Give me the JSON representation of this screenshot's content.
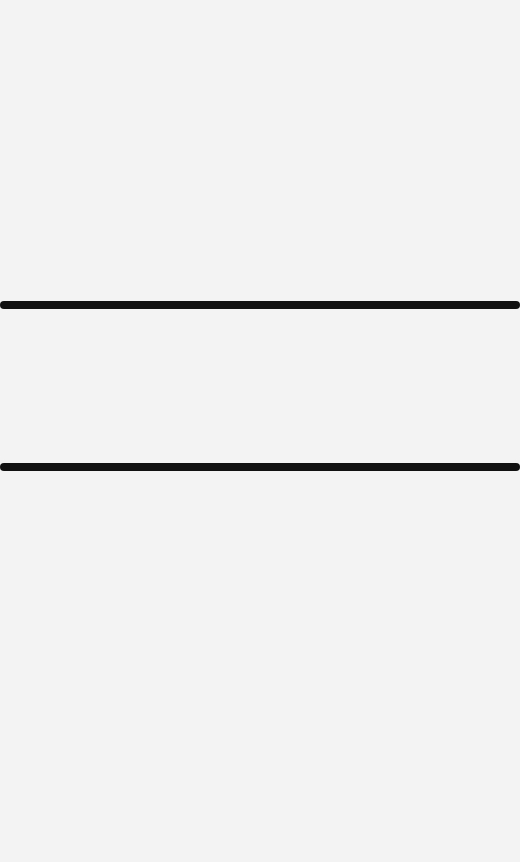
{
  "screen": {
    "background_color": "#f3f3f3",
    "state": "blank"
  },
  "sections": [
    {
      "name": "top-region",
      "top": 0,
      "height": 301
    },
    {
      "name": "middle-region",
      "top": 309,
      "height": 154
    },
    {
      "name": "bottom-region",
      "top": 471,
      "height": 391
    }
  ],
  "dividers": [
    {
      "name": "divider-top",
      "top": 301,
      "height": 8,
      "color": "#111111"
    },
    {
      "name": "divider-bottom",
      "top": 463,
      "height": 8,
      "color": "#111111"
    }
  ]
}
